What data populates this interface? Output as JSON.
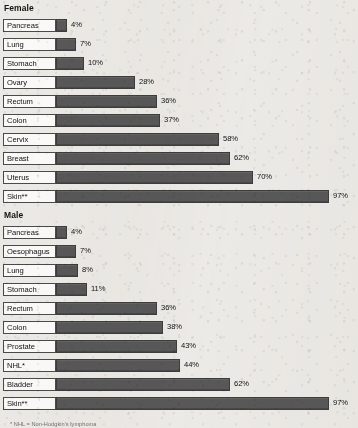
{
  "chart_data": {
    "type": "bar",
    "orientation": "horizontal",
    "title": "",
    "xlabel": "",
    "ylabel": "",
    "xlim": [
      0,
      100
    ],
    "grid": false,
    "legend": "none",
    "value_suffix": "%",
    "panels": [
      {
        "heading": "Female",
        "categories": [
          "Pancreas",
          "Lung",
          "Stomach",
          "Ovary",
          "Rectum",
          "Colon",
          "Cervix",
          "Breast",
          "Uterus",
          "Skin**"
        ],
        "values": [
          4,
          7,
          10,
          28,
          36,
          37,
          58,
          62,
          70,
          97
        ],
        "value_labels": [
          "4%",
          "7%",
          "10%",
          "28%",
          "36%",
          "37%",
          "58%",
          "62%",
          "70%",
          "97%"
        ]
      },
      {
        "heading": "Male",
        "categories": [
          "Pancreas",
          "Oesophagus",
          "Lung",
          "Stomach",
          "Rectum",
          "Colon",
          "Prostate",
          "NHL*",
          "Bladder",
          "Skin**"
        ],
        "values": [
          4,
          7,
          8,
          11,
          36,
          38,
          43,
          44,
          62,
          97
        ],
        "value_labels": [
          "4%",
          "7%",
          "8%",
          "11%",
          "36%",
          "38%",
          "43%",
          "44%",
          "62%",
          "97%"
        ]
      }
    ],
    "footnotes": [
      "* NHL = Non-Hodgkin's lymphoma"
    ],
    "colors": {
      "bar_fill": "#585858",
      "bar_border": "#3d3d3d",
      "label_box_fill": "#fbfaf8",
      "label_box_border": "#4a4a4a",
      "page_background": "#eceae6",
      "text": "#121212"
    }
  }
}
